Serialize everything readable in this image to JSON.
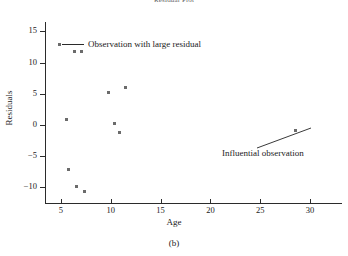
{
  "figure": {
    "title": "Residual Plot",
    "caption": "(b)"
  },
  "chart_data": {
    "type": "scatter",
    "title": "Residual Plot",
    "xlabel": "Age",
    "ylabel": "Residuals",
    "xlim": [
      3.5,
      31.5
    ],
    "ylim": [
      -12.5,
      16.5
    ],
    "xticks": [
      5,
      10,
      15,
      20,
      25,
      30
    ],
    "yticks": [
      15,
      10,
      5,
      0,
      -5,
      -10
    ],
    "ytick_labels": [
      "15",
      "10",
      "5",
      "0",
      "−5",
      "−10"
    ],
    "grid": false,
    "series": [
      {
        "name": "Residuals",
        "points": [
          {
            "x": 5.6,
            "y": 0.8
          },
          {
            "x": 6.4,
            "y": 11.8
          },
          {
            "x": 7.1,
            "y": 11.8
          },
          {
            "x": 5.8,
            "y": -7.2
          },
          {
            "x": 6.6,
            "y": -9.9
          },
          {
            "x": 7.4,
            "y": -10.7
          },
          {
            "x": 9.8,
            "y": 5.2
          },
          {
            "x": 10.4,
            "y": 0.2
          },
          {
            "x": 10.9,
            "y": -1.2
          },
          {
            "x": 11.5,
            "y": 6.0
          },
          {
            "x": 28.5,
            "y": -0.9
          }
        ]
      }
    ],
    "legend": {
      "position": "top-left",
      "entries": [
        "Observation with large residual"
      ]
    },
    "annotations": [
      {
        "text": "Influential observation",
        "target_x": 28.5,
        "target_y": -0.9
      }
    ]
  },
  "legend": {
    "large_residual_label": "Observation with large residual"
  },
  "annotations": {
    "influential_label": "Influential observation"
  }
}
